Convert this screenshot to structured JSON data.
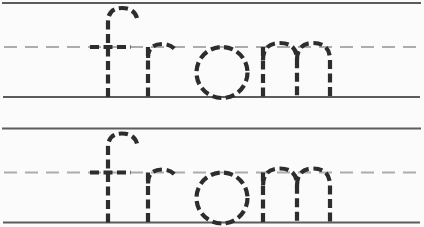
{
  "worksheet": {
    "type": "handwriting-tracing-practice",
    "word": "from",
    "repetitions": 2,
    "rows": [
      {
        "name": "practice-row-1",
        "word": "from"
      },
      {
        "name": "practice-row-2",
        "word": "from"
      }
    ],
    "guides": {
      "top_line_style": "solid",
      "midline_style": "dashed",
      "baseline_style": "solid"
    },
    "colors": {
      "background": "#fbfbfb",
      "guide_solid": "#5c5c5c",
      "guide_midline": "#acacac",
      "trace_letter": "#2d2d2d"
    }
  }
}
